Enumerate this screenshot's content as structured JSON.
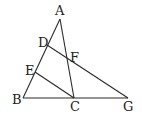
{
  "diagram": {
    "type": "geometry-triangle",
    "points": {
      "A": {
        "label": "A",
        "x": 60,
        "y": 19,
        "lx": 55,
        "ly": 15
      },
      "B": {
        "label": "B",
        "x": 23,
        "y": 98,
        "lx": 12,
        "ly": 104
      },
      "C": {
        "label": "C",
        "x": 74,
        "y": 98,
        "lx": 70,
        "ly": 111
      },
      "G": {
        "label": "G",
        "x": 128,
        "y": 98,
        "lx": 123,
        "ly": 111
      },
      "D": {
        "label": "D",
        "x": 47,
        "y": 45,
        "lx": 38,
        "ly": 47
      },
      "E": {
        "label": "E",
        "x": 35,
        "y": 72,
        "lx": 25,
        "ly": 75
      },
      "F": {
        "label": "F",
        "x": 68,
        "y": 58,
        "lx": 70,
        "ly": 62
      }
    },
    "segments": [
      {
        "name": "segment-AB",
        "from": "A",
        "to": "B"
      },
      {
        "name": "segment-AC",
        "from": "A",
        "to": "C"
      },
      {
        "name": "segment-BG",
        "from": "B",
        "to": "G"
      },
      {
        "name": "segment-DG",
        "from": "D",
        "to": "G"
      },
      {
        "name": "segment-EC",
        "from": "E",
        "to": "C"
      }
    ]
  }
}
